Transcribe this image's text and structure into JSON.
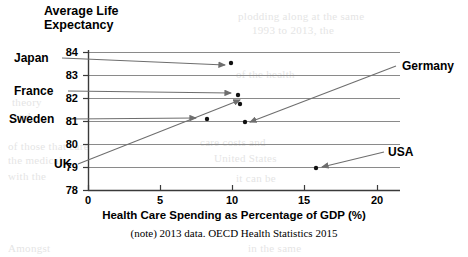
{
  "chart": {
    "title": "Average Life\nExpectancy",
    "x_axis_title": "Health Care Spending as Percentage of GDP (%)",
    "note": "(note) 2013 data. OECD Health Statistics 2015"
  },
  "ghost_text": [
    {
      "x": 238,
      "y": 10,
      "text": "plodding along at the same"
    },
    {
      "x": 252,
      "y": 24,
      "text": "1993 to 2013, the"
    },
    {
      "x": 12,
      "y": 96,
      "text": "theory"
    },
    {
      "x": 14,
      "y": 110,
      "text": "and"
    },
    {
      "x": 236,
      "y": 68,
      "text": "of the health"
    },
    {
      "x": 8,
      "y": 140,
      "text": "of those that care"
    },
    {
      "x": 200,
      "y": 136,
      "text": "care costs and"
    },
    {
      "x": 8,
      "y": 154,
      "text": "the medical"
    },
    {
      "x": 214,
      "y": 152,
      "text": "United States"
    },
    {
      "x": 8,
      "y": 170,
      "text": "with the"
    },
    {
      "x": 236,
      "y": 172,
      "text": "it can be"
    },
    {
      "x": 8,
      "y": 242,
      "text": "Amongst"
    },
    {
      "x": 248,
      "y": 242,
      "text": "in the same"
    }
  ],
  "chart_data": {
    "type": "scatter",
    "title": "Average Life Expectancy",
    "xlabel": "Health Care Spending as Percentage of GDP (%)",
    "ylabel": "Average Life Expectancy",
    "xlim": [
      0,
      20
    ],
    "ylim": [
      78,
      84
    ],
    "xticks": [
      0,
      5,
      10,
      15,
      20
    ],
    "yticks": [
      78,
      79,
      80,
      81,
      82,
      83,
      84
    ],
    "grid": true,
    "legend": "none",
    "points": [
      {
        "label": "Japan",
        "x": 9.9,
        "y": 83.5,
        "label_side": "left"
      },
      {
        "label": "France",
        "x": 10.4,
        "y": 82.3,
        "label_side": "left"
      },
      {
        "label": "Sweden",
        "x": 8.2,
        "y": 81.1,
        "label_side": "left"
      },
      {
        "label": "UK",
        "x": 8.5,
        "y": 81.1,
        "label_side": "left"
      },
      {
        "label": "Germany",
        "x": 10.9,
        "y": 80.9,
        "label_side": "right"
      },
      {
        "label": "USA",
        "x": 16.4,
        "y": 78.8,
        "label_side": "right"
      }
    ]
  },
  "labels": {
    "japan": "Japan",
    "france": "France",
    "sweden": "Sweden",
    "uk": "UK",
    "germany": "Germany",
    "usa": "USA"
  },
  "yticks": {
    "t84": "84",
    "t83": "83",
    "t82": "82",
    "t81": "81",
    "t80": "80",
    "t79": "79",
    "t78": "78"
  },
  "xticks": {
    "t0": "0",
    "t5": "5",
    "t10": "10",
    "t15": "15",
    "t20": "20"
  },
  "colors": {
    "axis": "#3a3a3a",
    "grid": "#8a8a8a",
    "point": "#111111",
    "leader": "#6e6e6e",
    "text": "#000000",
    "ghost": "#cfcfcf"
  }
}
